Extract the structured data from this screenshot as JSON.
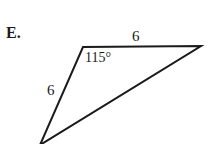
{
  "problem": {
    "letter": "E."
  },
  "triangle": {
    "side_top_label": "6",
    "side_left_label": "6",
    "angle_label": "115°",
    "stroke_color": "#1a1a1a"
  }
}
